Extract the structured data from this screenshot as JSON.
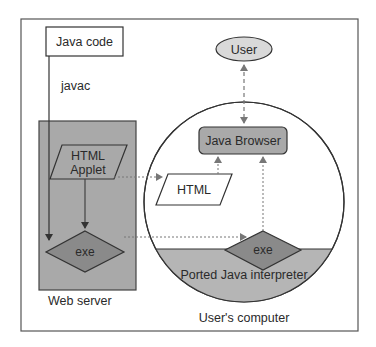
{
  "diagram": {
    "nodes": {
      "java_code": "Java code",
      "javac": "javac",
      "html_applet_line1": "HTML",
      "html_applet_line2": "Applet",
      "exe_server": "exe",
      "web_server": "Web server",
      "user": "User",
      "java_browser": "Java Browser",
      "html_client": "HTML",
      "exe_client": "exe",
      "ported_interpreter": "Ported Java interpreter",
      "users_computer": "User's computer"
    },
    "colors": {
      "frame": "#555555",
      "server_fill": "#a9a9a9",
      "dark_fill": "#8a8a8a",
      "light_fill": "#d9d9d9",
      "line": "#333333",
      "dotted": "#777777"
    }
  }
}
